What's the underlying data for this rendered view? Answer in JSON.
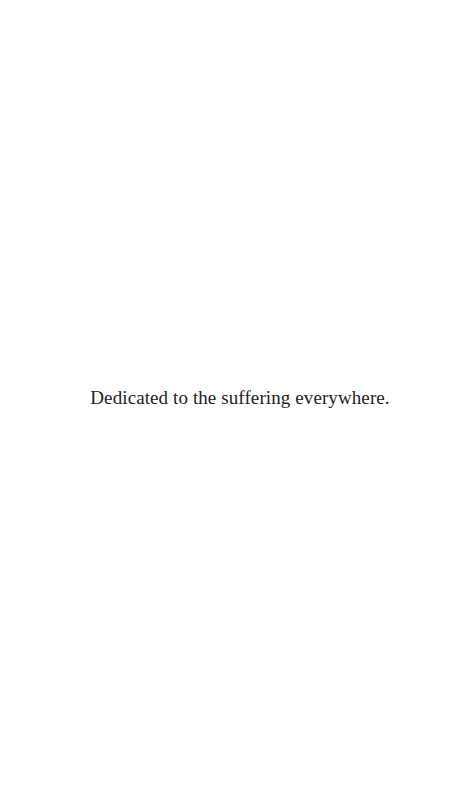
{
  "page": {
    "dedication": "Dedicated to the suffering everywhere."
  }
}
